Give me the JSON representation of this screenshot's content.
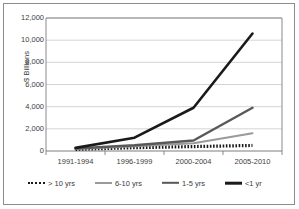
{
  "chart_data": {
    "type": "line",
    "title": "",
    "xlabel": "",
    "ylabel": "$ Billions",
    "categories": [
      "1991-1994",
      "1996-1999",
      "2000-2004",
      "2005-2010"
    ],
    "ylim": [
      0,
      12000
    ],
    "ytick_values": [
      0,
      2000,
      4000,
      6000,
      8000,
      10000,
      12000
    ],
    "ytick_labels": [
      "0",
      "2,000",
      "4,000",
      "6,000",
      "8,000",
      "10,000",
      "12,000"
    ],
    "grid": true,
    "legend_position": "bottom",
    "series": [
      {
        "name": "> 10 yrs",
        "values": [
          150,
          300,
          400,
          500
        ],
        "color": "#1a1a1a",
        "style": "dotted",
        "width": 3.2
      },
      {
        "name": "6-10 yrs",
        "values": [
          180,
          420,
          700,
          1600
        ],
        "color": "#9a9a9a",
        "style": "solid",
        "width": 2.0
      },
      {
        "name": "1-5 yrs",
        "values": [
          220,
          520,
          950,
          3900
        ],
        "color": "#595959",
        "style": "solid",
        "width": 2.4
      },
      {
        "name": "<1 yr",
        "values": [
          280,
          1200,
          3900,
          10600
        ],
        "color": "#1a1a1a",
        "style": "solid",
        "width": 2.6
      }
    ]
  },
  "axis": {
    "y_title": "$ Billions"
  },
  "legend": {
    "items": [
      {
        "label": "> 10 yrs"
      },
      {
        "label": "6-10 yrs"
      },
      {
        "label": "1-5 yrs"
      },
      {
        "label": "<1 yr"
      }
    ]
  },
  "colors": {
    "grid": "#c9c9c9",
    "axis": "#7d7d7d",
    "frame": "#8c8c8c",
    "text": "#3d3d3d"
  }
}
